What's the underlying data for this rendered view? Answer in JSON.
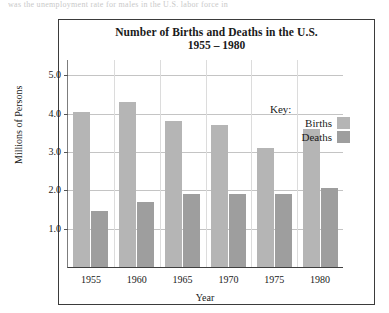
{
  "scan_artifact": {
    "top_cut_text": "was the unemployment rate for males in the U.S. labor force in"
  },
  "chart_data": {
    "type": "bar",
    "title": "Number of Births and Deaths in the U.S.",
    "subtitle": "1955 – 1980",
    "xlabel": "Year",
    "ylabel": "Millions of Persons",
    "categories": [
      "1955",
      "1960",
      "1965",
      "1970",
      "1975",
      "1980"
    ],
    "series": [
      {
        "name": "Births",
        "color": "#b5b5b5",
        "values": [
          4.05,
          4.3,
          3.8,
          3.7,
          3.1,
          3.6
        ]
      },
      {
        "name": "Deaths",
        "color": "#9e9e9e",
        "values": [
          1.45,
          1.7,
          1.9,
          1.9,
          1.9,
          2.05
        ]
      }
    ],
    "ylim": [
      0,
      5.4
    ],
    "yticks": [
      "1.0",
      "2.0",
      "3.0",
      "4.0",
      "5.0"
    ],
    "ytick_values": [
      1.0,
      2.0,
      3.0,
      4.0,
      5.0
    ],
    "grid": "horizontal-and-vertical",
    "legend_position": "inside-right"
  },
  "legend": {
    "title": "Key:",
    "entries": [
      {
        "label": "Births",
        "color": "#b5b5b5"
      },
      {
        "label": "Deaths",
        "color": "#9e9e9e"
      }
    ]
  }
}
